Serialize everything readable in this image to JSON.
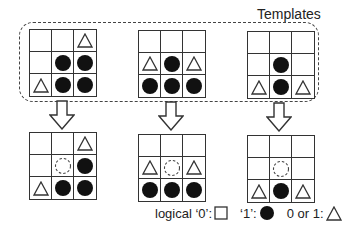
{
  "title": "Templates",
  "symbols": {
    "zero": "square",
    "one": "filled-circle",
    "either": "triangle",
    "candidate": "dashed-circle",
    "blank": "empty"
  },
  "templates": [
    {
      "cells": [
        "blank",
        "blank",
        "triangle",
        "blank",
        "filled-circle",
        "filled-circle",
        "triangle",
        "filled-circle",
        "filled-circle"
      ]
    },
    {
      "cells": [
        "blank",
        "blank",
        "blank",
        "triangle",
        "filled-circle",
        "triangle",
        "filled-circle",
        "filled-circle",
        "filled-circle"
      ]
    },
    {
      "cells": [
        "blank",
        "blank",
        "blank",
        "blank",
        "filled-circle",
        "blank",
        "triangle",
        "filled-circle",
        "triangle"
      ]
    }
  ],
  "results": [
    {
      "cells": [
        "blank",
        "blank",
        "triangle",
        "blank",
        "dashed-circle",
        "filled-circle",
        "triangle",
        "filled-circle",
        "filled-circle"
      ]
    },
    {
      "cells": [
        "blank",
        "blank",
        "blank",
        "triangle",
        "dashed-circle",
        "triangle",
        "filled-circle",
        "filled-circle",
        "filled-circle"
      ]
    },
    {
      "cells": [
        "blank",
        "blank",
        "blank",
        "blank",
        "dashed-circle",
        "blank",
        "triangle",
        "filled-circle",
        "triangle"
      ]
    }
  ],
  "legend": {
    "zero_label": "logical ‘0’:",
    "one_label": "‘1’:",
    "either_label": "0 or 1:"
  },
  "colors": {
    "ink": "#111111",
    "line": "#333333",
    "dash": "#444444",
    "background": "#ffffff"
  }
}
